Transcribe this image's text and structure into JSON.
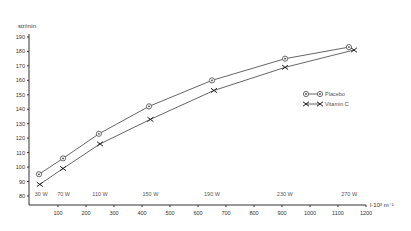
{
  "chart_data": {
    "type": "line",
    "title": "",
    "ylabel": "str/min",
    "xlabel": "l·10³ m⁻¹",
    "xlim": [
      0,
      1200
    ],
    "ylim": [
      80,
      190
    ],
    "x_ticks": [
      100,
      200,
      300,
      400,
      500,
      600,
      700,
      800,
      900,
      1000,
      1100,
      1200
    ],
    "y_ticks": [
      80,
      90,
      100,
      110,
      120,
      130,
      140,
      150,
      160,
      170,
      180,
      190
    ],
    "grid": false,
    "legend_position": "right",
    "power_labels": [
      {
        "x": 40,
        "label": "30 W"
      },
      {
        "x": 120,
        "label": "70 W"
      },
      {
        "x": 250,
        "label": "110 W"
      },
      {
        "x": 430,
        "label": "150 W"
      },
      {
        "x": 650,
        "label": "190 W"
      },
      {
        "x": 910,
        "label": "230 W"
      },
      {
        "x": 1140,
        "label": "270 W"
      }
    ],
    "series": [
      {
        "name": "Placebo",
        "marker": "circle",
        "x": [
          32,
          118,
          246,
          425,
          650,
          911,
          1139
        ],
        "y": [
          95,
          106,
          123,
          142,
          160,
          175,
          183
        ]
      },
      {
        "name": "Vitamin C",
        "marker": "x",
        "x": [
          35,
          118,
          250,
          430,
          657,
          911,
          1157
        ],
        "y": [
          88,
          99,
          116,
          133,
          153,
          169,
          181
        ]
      }
    ]
  }
}
